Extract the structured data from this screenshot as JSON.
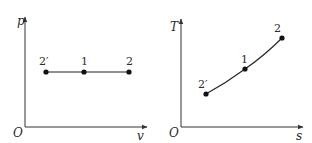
{
  "diagrams": {
    "pv": {
      "y_axis_label": "p",
      "x_axis_label": "v",
      "origin_label": "O",
      "points": [
        {
          "id": "2prime",
          "label": "2′",
          "x": 46,
          "y": 72,
          "label_x": 39,
          "label_y": 64
        },
        {
          "id": "1",
          "label": "1",
          "x": 84,
          "y": 72,
          "label_x": 81,
          "label_y": 64
        },
        {
          "id": "2",
          "label": "2",
          "x": 129,
          "y": 72,
          "label_x": 126,
          "label_y": 64
        }
      ],
      "process": "isobaric (horizontal line)"
    },
    "ts": {
      "y_axis_label": "T",
      "x_axis_label": "s",
      "origin_label": "O",
      "points": [
        {
          "id": "2prime",
          "label": "2′",
          "x": 206,
          "y": 94,
          "label_x": 198,
          "label_y": 86
        },
        {
          "id": "1",
          "label": "1",
          "x": 245,
          "y": 69,
          "label_x": 240,
          "label_y": 62
        },
        {
          "id": "2",
          "label": "2",
          "x": 282,
          "y": 38,
          "label_x": 274,
          "label_y": 30
        }
      ],
      "process": "isobaric (convex upward curve)"
    }
  },
  "colors": {
    "background": "#ffffff",
    "ink": "#222222"
  }
}
